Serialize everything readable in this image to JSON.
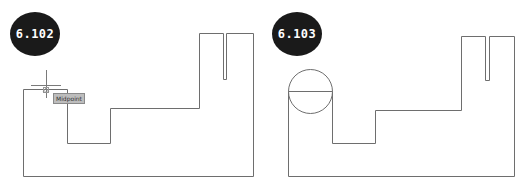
{
  "figures": [
    {
      "id": "left",
      "badge": "6.102",
      "tooltip": "Midpoint",
      "stroke_color": "#6e6e6e",
      "badge_color": "#1a1a1a"
    },
    {
      "id": "right",
      "badge": "6.103",
      "stroke_color": "#6e6e6e",
      "badge_color": "#1a1a1a"
    }
  ]
}
